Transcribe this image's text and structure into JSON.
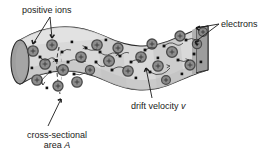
{
  "figure": {
    "type": "physics-illustration",
    "background": "#ffffff"
  },
  "labels": {
    "positive_ions": "positive ions",
    "electrons": "electrons",
    "drift_velocity": "drift velocity ",
    "drift_velocity_symbol": "v",
    "cross_sectional_line1": "cross-sectional",
    "cross_sectional_line2": "area ",
    "cross_sectional_symbol": "A"
  },
  "colors": {
    "tube_body": "#d9d9d9",
    "tube_shade": "#bdbdbd",
    "end_cap_left": "#9e9e9e",
    "end_cap_right": "#a5a5a5",
    "ion_fill": "#8d8d8d",
    "ion_rim": "#4a4a4a",
    "electron": "#111111",
    "outline": "#2b2b2b",
    "text": "#1a1a1a",
    "leader": "#1a1a1a"
  },
  "elements": {
    "tube_name": "conductor-tube",
    "left_cap_name": "left-end-cap",
    "right_cap_name": "right-end-cap",
    "cross_section_name": "cross-section-dashed-line",
    "ion_name": "positive-ion",
    "electron_name": "electron",
    "electron_path_name": "electron-random-path"
  },
  "counts": {
    "positive_ions": 22,
    "electrons": 24
  }
}
